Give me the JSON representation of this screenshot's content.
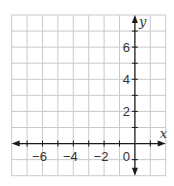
{
  "chart_data": {
    "type": "line",
    "title": "",
    "xlabel": "x",
    "ylabel": "y",
    "xlim": [
      -8,
      2
    ],
    "ylim": [
      -2,
      8
    ],
    "grid": true,
    "grid_step": 1,
    "x_tick_labels": [
      {
        "value": -6,
        "label": "−6"
      },
      {
        "value": -4,
        "label": "−4"
      },
      {
        "value": -2,
        "label": "−2"
      }
    ],
    "y_tick_labels": [
      {
        "value": 6,
        "label": "6"
      },
      {
        "value": 4,
        "label": "4"
      },
      {
        "value": 2,
        "label": "2"
      }
    ],
    "origin_label": "0",
    "series": [],
    "colors": {
      "grid": "#c9c9c9",
      "axis": "#1a1a1a",
      "text": "#333333"
    }
  },
  "layout": {
    "x0_px": 11.7,
    "x_step_px": 15.4,
    "y_top_px": 15,
    "y_step_px": 16.07
  }
}
